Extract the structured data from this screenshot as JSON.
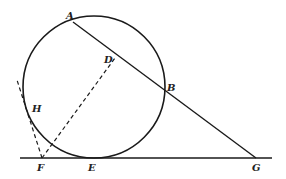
{
  "diagram": {
    "colors": {
      "background": "#ffffff",
      "stroke": "#1a1a1a",
      "label": "#222222"
    },
    "circle": {
      "cx": 94,
      "cy": 87,
      "r": 71
    },
    "points": {
      "A": {
        "label": "A",
        "x": 73,
        "y": 22,
        "lx": 66,
        "ly": 11
      },
      "D": {
        "label": "D",
        "x": 115,
        "y": 58,
        "lx": 104,
        "ly": 55
      },
      "B": {
        "label": "B",
        "x": 164,
        "y": 90,
        "lx": 167,
        "ly": 83
      },
      "H": {
        "label": "H",
        "x": 27,
        "y": 105,
        "lx": 32,
        "ly": 104
      },
      "F": {
        "label": "F",
        "x": 42,
        "y": 158,
        "lx": 37,
        "ly": 163
      },
      "E": {
        "label": "E",
        "x": 94,
        "y": 158,
        "lx": 88,
        "ly": 163
      },
      "G": {
        "label": "G",
        "x": 256,
        "y": 158,
        "lx": 252,
        "ly": 163
      }
    },
    "lines": [
      {
        "name": "secant-line-ag",
        "x1": 73,
        "y1": 22,
        "x2": 256,
        "y2": 158,
        "dashed": false
      },
      {
        "name": "tangent-line-base",
        "x1": 20,
        "y1": 158,
        "x2": 272,
        "y2": 158,
        "dashed": false
      },
      {
        "name": "dashed-line-fd",
        "x1": 42,
        "y1": 158,
        "x2": 115,
        "y2": 58,
        "dashed": true
      },
      {
        "name": "dashed-tangent-fh",
        "x1": 42,
        "y1": 158,
        "x2": 17,
        "y2": 80,
        "dashed": true
      }
    ]
  }
}
